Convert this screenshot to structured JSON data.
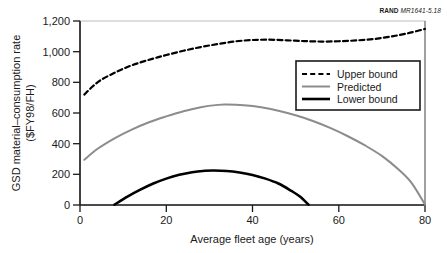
{
  "figure": {
    "source_id_prefix": "RAND",
    "source_id_number": "MR1641-5.18"
  },
  "chart_data": {
    "type": "line",
    "title": "",
    "subtitle": "",
    "xlabel": "Average fleet age (years)",
    "ylabel_line1": "GSD material–consumption rate",
    "ylabel_line2": "($FY98/FH)",
    "xlim": [
      0,
      80
    ],
    "ylim": [
      0,
      1200
    ],
    "xticks": [
      0,
      20,
      40,
      60,
      80
    ],
    "xtick_labels": [
      "0",
      "20",
      "40",
      "60",
      "80"
    ],
    "yticks": [
      0,
      200,
      400,
      600,
      800,
      1000,
      1200
    ],
    "ytick_labels": [
      "0",
      "200",
      "400",
      "600",
      "800",
      "1,000",
      "1,200"
    ],
    "grid": false,
    "legend_position": "upper-right-inside",
    "series": [
      {
        "name": "Upper bound",
        "style": "dashed",
        "color": "#000000",
        "width": 2.2,
        "x": [
          1,
          3,
          5,
          8,
          11,
          14,
          17,
          20,
          24,
          28,
          32,
          36,
          40,
          44,
          48,
          52,
          56,
          60,
          64,
          68,
          72,
          76,
          80
        ],
        "values": [
          720,
          775,
          818,
          862,
          900,
          930,
          955,
          978,
          1006,
          1030,
          1050,
          1067,
          1076,
          1078,
          1074,
          1069,
          1066,
          1068,
          1073,
          1082,
          1098,
          1120,
          1148
        ]
      },
      {
        "name": "Predicted",
        "style": "solid",
        "color": "#8c8c8c",
        "width": 2.0,
        "x": [
          1,
          4,
          8,
          12,
          16,
          20,
          24,
          28,
          32,
          34,
          38,
          42,
          46,
          50,
          54,
          58,
          62,
          66,
          70,
          74,
          77,
          80
        ],
        "values": [
          295,
          365,
          435,
          492,
          540,
          578,
          612,
          638,
          653,
          655,
          650,
          637,
          615,
          585,
          548,
          503,
          450,
          390,
          320,
          228,
          140,
          2
        ]
      },
      {
        "name": "Lower bound",
        "style": "solid",
        "color": "#000000",
        "width": 2.6,
        "x": [
          8,
          11,
          14,
          17,
          20,
          23,
          26,
          29,
          31,
          34,
          37,
          40,
          43,
          46,
          49,
          51,
          53
        ],
        "values": [
          2,
          55,
          100,
          140,
          172,
          197,
          214,
          223,
          225,
          222,
          212,
          196,
          172,
          140,
          92,
          55,
          2
        ]
      }
    ]
  },
  "legend": {
    "items": [
      {
        "label": "Upper bound"
      },
      {
        "label": "Predicted"
      },
      {
        "label": "Lower bound"
      }
    ]
  }
}
